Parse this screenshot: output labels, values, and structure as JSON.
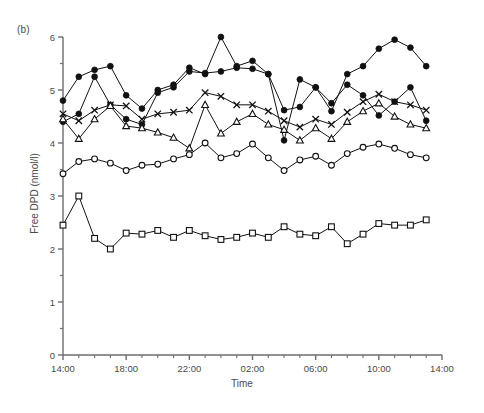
{
  "figure": {
    "panel_label": "(b)",
    "xlabel": "Time",
    "ylabel": "Free DPD (nmol/l)"
  },
  "chart_data": {
    "type": "line",
    "title": "",
    "subtitle": "",
    "panel": "(b)",
    "xlabel": "Time",
    "ylabel": "Free DPD (nmol/l)",
    "xlim": [
      0,
      24
    ],
    "ylim": [
      0,
      6
    ],
    "grid": false,
    "legend": null,
    "x_tick_labels": [
      "14:00",
      "18:00",
      "22:00",
      "02:00",
      "06:00",
      "10:00",
      "14:00"
    ],
    "x_tick_values": [
      0,
      4,
      8,
      12,
      16,
      20,
      24
    ],
    "x_minor_tick_step": 1,
    "y_ticks": [
      0,
      1,
      2,
      3,
      4,
      5,
      6
    ],
    "y_tick_labels": [
      "0",
      "1",
      "2",
      "3",
      "4",
      "5",
      "6"
    ],
    "y_minor_tick_step": 0.5,
    "x": [
      0,
      1,
      2,
      3,
      4,
      5,
      6,
      7,
      8,
      9,
      10,
      11,
      12,
      13,
      14,
      15,
      16,
      17,
      18,
      19,
      20,
      21,
      22,
      23
    ],
    "series": [
      {
        "name": "subject-1",
        "marker": "filled-circle",
        "values": [
          4.8,
          5.25,
          5.38,
          5.45,
          4.9,
          4.65,
          5.0,
          5.1,
          5.42,
          5.3,
          6.0,
          5.45,
          5.55,
          5.3,
          4.05,
          5.2,
          5.05,
          4.6,
          5.3,
          5.45,
          5.78,
          5.95,
          5.8,
          5.45
        ]
      },
      {
        "name": "subject-2",
        "marker": "filled-circle",
        "values": [
          4.4,
          4.55,
          5.25,
          4.72,
          4.45,
          4.35,
          4.95,
          5.05,
          5.35,
          5.32,
          5.35,
          5.42,
          5.4,
          5.3,
          4.62,
          4.68,
          5.05,
          4.75,
          5.1,
          4.9,
          4.52,
          4.78,
          5.05,
          4.42
        ]
      },
      {
        "name": "subject-3",
        "marker": "x",
        "values": [
          4.55,
          4.42,
          4.62,
          4.72,
          4.7,
          4.45,
          4.55,
          4.58,
          4.62,
          4.95,
          4.88,
          4.72,
          4.72,
          4.6,
          4.42,
          4.3,
          4.45,
          4.35,
          4.58,
          4.78,
          4.92,
          4.78,
          4.72,
          4.62
        ]
      },
      {
        "name": "subject-4",
        "marker": "open-triangle",
        "values": [
          4.45,
          4.08,
          4.45,
          4.7,
          4.32,
          4.28,
          4.2,
          4.1,
          3.9,
          4.72,
          4.18,
          4.4,
          4.55,
          4.35,
          4.25,
          4.05,
          4.28,
          4.08,
          4.4,
          4.6,
          4.75,
          4.5,
          4.35,
          4.28
        ]
      },
      {
        "name": "subject-5",
        "marker": "open-circle",
        "values": [
          3.42,
          3.65,
          3.7,
          3.62,
          3.48,
          3.58,
          3.6,
          3.7,
          3.78,
          4.0,
          3.72,
          3.8,
          3.98,
          3.72,
          3.48,
          3.68,
          3.75,
          3.58,
          3.8,
          3.92,
          3.98,
          3.9,
          3.78,
          3.72
        ]
      },
      {
        "name": "subject-6",
        "marker": "open-square",
        "values": [
          2.45,
          3.0,
          2.2,
          2.0,
          2.3,
          2.28,
          2.35,
          2.22,
          2.35,
          2.25,
          2.18,
          2.22,
          2.3,
          2.22,
          2.42,
          2.28,
          2.25,
          2.42,
          2.1,
          2.28,
          2.48,
          2.45,
          2.45,
          2.55
        ]
      }
    ]
  }
}
